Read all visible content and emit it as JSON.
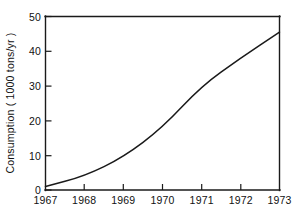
{
  "figure": {
    "name": "consumption-line-chart",
    "background_color": "#ffffff",
    "ink_color": "#1a1a1a"
  },
  "chart_data": {
    "type": "line",
    "title": "",
    "xlabel": "",
    "ylabel": "Consumption ( 1000 tons/yr )",
    "x": [
      1967,
      1968,
      1969,
      1970,
      1971,
      1972,
      1973
    ],
    "values": [
      1,
      4,
      9.5,
      18,
      30,
      38,
      45.5
    ],
    "series": [
      {
        "name": "Consumption",
        "values": [
          1,
          4,
          9.5,
          18,
          30,
          38,
          45.5
        ]
      }
    ],
    "xlim": [
      1967,
      1973
    ],
    "ylim": [
      0,
      50
    ],
    "xticks": [
      1967,
      1968,
      1969,
      1970,
      1971,
      1972,
      1973
    ],
    "xticklabels": [
      "1967",
      "1968",
      "1969",
      "1970",
      "1971",
      "1972",
      "1973"
    ],
    "yticks": [
      0,
      10,
      20,
      30,
      40,
      50
    ],
    "yticklabels": [
      "0",
      "10",
      "20",
      "30",
      "40",
      "50"
    ],
    "grid": false,
    "legend": false,
    "legend_position": "none",
    "line_color": "#1a1a1a",
    "markers": false
  },
  "axes": {
    "y_title": "Consumption ( 1000 tons/yr )",
    "y_tick_labels": [
      "50",
      "40",
      "30",
      "20",
      "10",
      "0"
    ],
    "x_tick_labels": [
      "1967",
      "1968",
      "1969",
      "1970",
      "1971",
      "1972",
      "1973"
    ]
  }
}
